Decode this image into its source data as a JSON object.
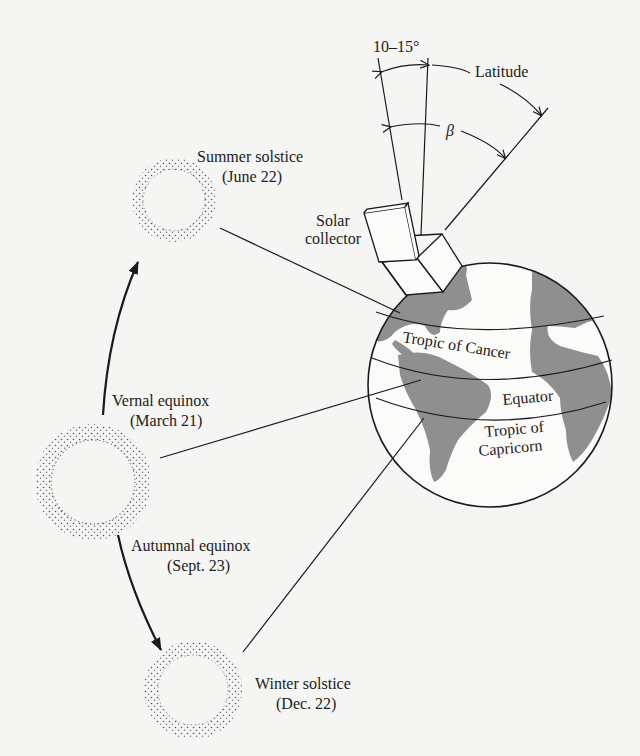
{
  "diagram": {
    "type": "earth-sun-orbit-solar-collector",
    "colors": {
      "background": "#f5f5f3",
      "line": "#1a1a1a",
      "land": "#8f8f8f",
      "sun_stipple": "#555555"
    },
    "angles": {
      "tilt_label": "10–15°",
      "latitude_label": "Latitude",
      "beta_label": "β"
    },
    "collector": {
      "label_line1": "Solar",
      "label_line2": "collector"
    },
    "earth": {
      "tropic_cancer": "Tropic of Cancer",
      "equator": "Equator",
      "tropic_capricorn_line1": "Tropic of",
      "tropic_capricorn_line2": "Capricorn"
    },
    "sun_positions": [
      {
        "name": "Summer solstice",
        "date": "(June 22)"
      },
      {
        "name": "Vernal equinox",
        "date": "(March 21)"
      },
      {
        "name": "Autumnal equinox",
        "date": "(Sept. 23)"
      },
      {
        "name": "Winter solstice",
        "date": "(Dec. 22)"
      }
    ]
  }
}
